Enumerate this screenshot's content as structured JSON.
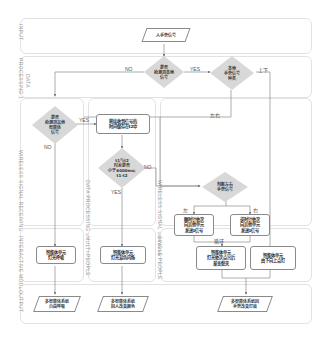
{
  "lanes": {
    "input": "INPUT",
    "processing1": "PROCESSING 1",
    "data": "DATA",
    "wireless_receiving": "WIRELESS SIGNAL RECEIVING",
    "data_processing2": "DATA PROCESSING 2",
    "wireless_sending": "WIRELESS SIGNAL SENDING",
    "interactive_mode": "INTERACTIVE MODE",
    "multi_people": "MULTI-PEOPLE",
    "single_people": "SINGLE PEOPLE",
    "output": "OUTPUT"
  },
  "nodes": {
    "input_gesture": "人手势信号",
    "detect_local": "是否\n检测到本地\n信号",
    "gesture_type": "本地\n手势信号\n种类",
    "detect_other": "是否\n检测到其他\n智能体\n信号",
    "store_t2": "将接收到信号的\n时间储存在t2中",
    "time_diff": "t1与t2\n时差是否\n小于6000ms;\nt1-t2",
    "judge_lr": "判断左右\n手势信号",
    "clockwise": "顺时针依次\n向其他单元\n发送1信号",
    "counterclockwise": "逆时针依次\n向其他单元\n发送1信号",
    "breath_light": "智能体单元\n灯光呼吸",
    "mix_flash": "智能体单元\n灯光混色闪烁",
    "light_on_loop": "智能体单元\n灯光依次点亮后\n渐变熄灭",
    "light_up_down": "智能体单元\n由下向上点灯",
    "out_free_breath": "多智能体系统\n自由呼吸",
    "out_color_change": "多智能体系统\n因人改变颜色",
    "out_gesture_effect": "多智能体系统因\n手势改变灯效"
  },
  "edge_labels": {
    "no_top": "NO",
    "yes_top": "YES",
    "up_down": "上下",
    "left_right": "左右",
    "yes_left": "YES",
    "no_left": "NO",
    "no_mid": "NO",
    "yes_mid": "YES",
    "left": "左",
    "right": "右",
    "loop": "循环"
  }
}
